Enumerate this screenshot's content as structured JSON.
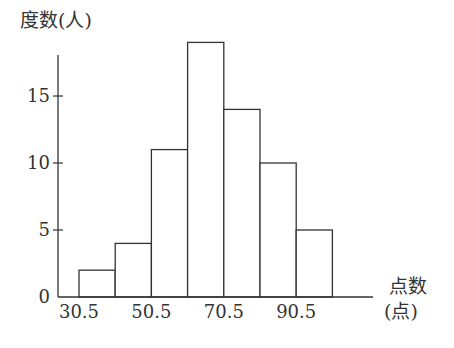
{
  "chart_data": {
    "type": "bar",
    "subtype": "histogram",
    "title": "",
    "ylabel": "度数(人)",
    "xlabel_line1": "点数",
    "xlabel_line2": "(点)",
    "bin_edges": [
      30.5,
      40.5,
      50.5,
      60.5,
      70.5,
      80.5,
      90.5,
      100.5
    ],
    "categories": [
      "30.5-40.5",
      "40.5-50.5",
      "50.5-60.5",
      "60.5-70.5",
      "70.5-80.5",
      "80.5-90.5",
      "90.5-100.5"
    ],
    "values": [
      2,
      4,
      11,
      19,
      14,
      10,
      5
    ],
    "x_tick_labels": [
      "30.5",
      "50.5",
      "70.5",
      "90.5"
    ],
    "x_tick_values": [
      30.5,
      50.5,
      70.5,
      90.5
    ],
    "y_ticks": [
      0,
      5,
      10,
      15
    ],
    "ylim": [
      0,
      20
    ],
    "grid": false,
    "legend": "none",
    "colors": {
      "bar_fill": "#ffffff",
      "bar_stroke": "#333333",
      "axis": "#333333"
    }
  }
}
